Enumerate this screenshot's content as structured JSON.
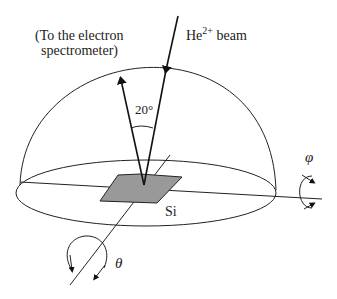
{
  "diagram": {
    "labels": {
      "spectrometer_line1": "(To the electron",
      "spectrometer_line2": "spectrometer)",
      "beam_prefix": "He",
      "beam_superscript": "2+",
      "beam_suffix": " beam",
      "angle": "20°",
      "sample": "Si",
      "phi": "φ",
      "theta": "θ"
    },
    "colors": {
      "stroke": "#222222",
      "sample_fill": "#999999"
    }
  }
}
